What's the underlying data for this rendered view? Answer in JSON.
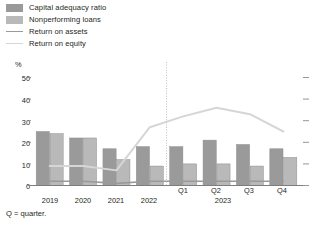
{
  "legend": {
    "items": [
      {
        "label": "Capital adequacy ratio",
        "kind": "bar",
        "color": "#9a9a9a"
      },
      {
        "label": "Nonperforming loans",
        "kind": "bar",
        "color": "#b9b9b9"
      },
      {
        "label": "Return on assets",
        "kind": "line",
        "color": "#9a9a9a"
      },
      {
        "label": "Return on equity",
        "kind": "line",
        "color": "#d6d6d6"
      }
    ]
  },
  "axis": {
    "unit": "%",
    "y_ticks": [
      "50",
      "40",
      "30",
      "20",
      "10",
      "0"
    ],
    "group_label_2023": "2023"
  },
  "footnote": "Q = quarter.",
  "chart_data": {
    "type": "bar",
    "title": "",
    "xlabel": "",
    "ylabel": "%",
    "ylim": [
      0,
      50
    ],
    "grid": false,
    "legend_position": "top-left",
    "categories": [
      "2019",
      "2020",
      "2021",
      "2022",
      "Q1",
      "Q2",
      "Q3",
      "Q4"
    ],
    "annual_labels": [
      "2019",
      "2020",
      "2021",
      "2022"
    ],
    "quarter_labels": [
      "Q1",
      "Q2",
      "Q3",
      "Q4"
    ],
    "divider_after_category": "2022",
    "series": [
      {
        "name": "Capital adequacy ratio",
        "type": "bar",
        "color": "#9a9a9a",
        "values": [
          25,
          22,
          17,
          18,
          18,
          21,
          19,
          17
        ]
      },
      {
        "name": "Nonperforming loans",
        "type": "bar",
        "color": "#b9b9b9",
        "values": [
          24,
          22,
          12,
          9,
          10,
          10,
          9,
          13
        ]
      },
      {
        "name": "Return on assets",
        "type": "line",
        "color": "#9a9a9a",
        "values": [
          2,
          2,
          1,
          2,
          2,
          2,
          2,
          2
        ]
      },
      {
        "name": "Return on equity",
        "type": "line",
        "color": "#d6d6d6",
        "values": [
          9,
          9,
          7,
          27,
          32,
          36,
          33,
          25
        ]
      }
    ]
  }
}
